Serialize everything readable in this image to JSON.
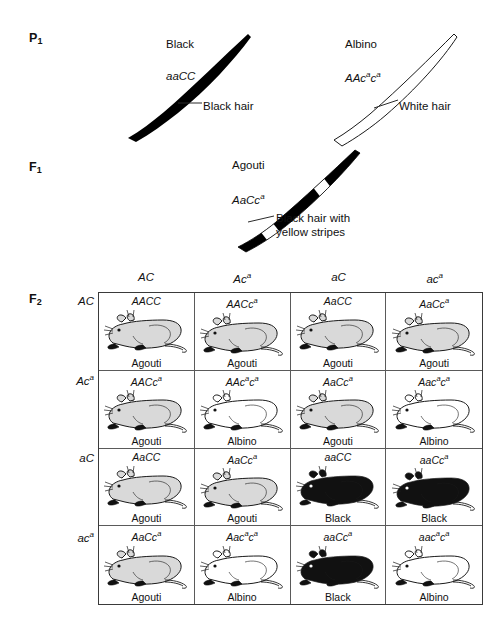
{
  "generations": {
    "p1": {
      "label": "P",
      "subscript": "1"
    },
    "f1": {
      "label": "F",
      "subscript": "1"
    },
    "f2": {
      "label": "F",
      "subscript": "2"
    }
  },
  "p1_parents": [
    {
      "phenotype": "Black",
      "genotype_plain": "aaCC",
      "genotype_parts": [
        {
          "t": "aaCC",
          "sup": false
        }
      ],
      "hair_callout": "Black hair",
      "hair_type": "solid-black"
    },
    {
      "phenotype": "Albino",
      "genotype_plain": "AAc a c a",
      "genotype_parts": [
        {
          "t": "AAc",
          "sup": false
        },
        {
          "t": "a",
          "sup": true
        },
        {
          "t": "c",
          "sup": false
        },
        {
          "t": "a",
          "sup": true
        }
      ],
      "hair_callout": "White hair",
      "hair_type": "white-outline"
    }
  ],
  "f1_offspring": {
    "phenotype": "Agouti",
    "genotype_plain": "AaCc a",
    "genotype_parts": [
      {
        "t": "AaCc",
        "sup": false
      },
      {
        "t": "a",
        "sup": true
      }
    ],
    "hair_callout_line1": "Black hair with",
    "hair_callout_line2": "yellow stripes",
    "hair_type": "banded"
  },
  "punnett": {
    "column_headers": [
      {
        "parts": [
          {
            "t": "AC",
            "sup": false
          }
        ]
      },
      {
        "parts": [
          {
            "t": "Ac",
            "sup": false
          },
          {
            "t": "a",
            "sup": true
          }
        ]
      },
      {
        "parts": [
          {
            "t": "aC",
            "sup": false
          }
        ]
      },
      {
        "parts": [
          {
            "t": "ac",
            "sup": false
          },
          {
            "t": "a",
            "sup": true
          }
        ]
      }
    ],
    "row_headers": [
      {
        "parts": [
          {
            "t": "AC",
            "sup": false
          }
        ]
      },
      {
        "parts": [
          {
            "t": "Ac",
            "sup": false
          },
          {
            "t": "a",
            "sup": true
          }
        ]
      },
      {
        "parts": [
          {
            "t": "aC",
            "sup": false
          }
        ]
      },
      {
        "parts": [
          {
            "t": "ac",
            "sup": false
          },
          {
            "t": "a",
            "sup": true
          }
        ]
      }
    ],
    "cells": [
      {
        "parts": [
          {
            "t": "AACC",
            "sup": false
          }
        ],
        "phenotype": "Agouti",
        "coat": "agouti"
      },
      {
        "parts": [
          {
            "t": "AACc",
            "sup": false
          },
          {
            "t": "a",
            "sup": true
          }
        ],
        "phenotype": "Agouti",
        "coat": "agouti"
      },
      {
        "parts": [
          {
            "t": "AaCC",
            "sup": false
          }
        ],
        "phenotype": "Agouti",
        "coat": "agouti"
      },
      {
        "parts": [
          {
            "t": "AaCc",
            "sup": false
          },
          {
            "t": "a",
            "sup": true
          }
        ],
        "phenotype": "Agouti",
        "coat": "agouti"
      },
      {
        "parts": [
          {
            "t": "AACc",
            "sup": false
          },
          {
            "t": "a",
            "sup": true
          }
        ],
        "phenotype": "Agouti",
        "coat": "agouti"
      },
      {
        "parts": [
          {
            "t": "AAc",
            "sup": false
          },
          {
            "t": "a",
            "sup": true
          },
          {
            "t": "c",
            "sup": false
          },
          {
            "t": "a",
            "sup": true
          }
        ],
        "phenotype": "Albino",
        "coat": "albino"
      },
      {
        "parts": [
          {
            "t": "AaCc",
            "sup": false
          },
          {
            "t": "a",
            "sup": true
          }
        ],
        "phenotype": "Agouti",
        "coat": "agouti"
      },
      {
        "parts": [
          {
            "t": "Aac",
            "sup": false
          },
          {
            "t": "a",
            "sup": true
          },
          {
            "t": "c",
            "sup": false
          },
          {
            "t": "a",
            "sup": true
          }
        ],
        "phenotype": "Albino",
        "coat": "albino"
      },
      {
        "parts": [
          {
            "t": "AaCC",
            "sup": false
          }
        ],
        "phenotype": "Agouti",
        "coat": "agouti"
      },
      {
        "parts": [
          {
            "t": "AaCc",
            "sup": false
          },
          {
            "t": "a",
            "sup": true
          }
        ],
        "phenotype": "Agouti",
        "coat": "agouti"
      },
      {
        "parts": [
          {
            "t": "aaCC",
            "sup": false
          }
        ],
        "phenotype": "Black",
        "coat": "black"
      },
      {
        "parts": [
          {
            "t": "aaCc",
            "sup": false
          },
          {
            "t": "a",
            "sup": true
          }
        ],
        "phenotype": "Black",
        "coat": "black"
      },
      {
        "parts": [
          {
            "t": "AaCc",
            "sup": false
          },
          {
            "t": "a",
            "sup": true
          }
        ],
        "phenotype": "Agouti",
        "coat": "agouti"
      },
      {
        "parts": [
          {
            "t": "Aac",
            "sup": false
          },
          {
            "t": "a",
            "sup": true
          },
          {
            "t": "c",
            "sup": false
          },
          {
            "t": "a",
            "sup": true
          }
        ],
        "phenotype": "Albino",
        "coat": "albino"
      },
      {
        "parts": [
          {
            "t": "aaCc",
            "sup": false
          },
          {
            "t": "a",
            "sup": true
          }
        ],
        "phenotype": "Black",
        "coat": "black"
      },
      {
        "parts": [
          {
            "t": "aac",
            "sup": false
          },
          {
            "t": "a",
            "sup": true
          },
          {
            "t": "c",
            "sup": false
          },
          {
            "t": "a",
            "sup": true
          }
        ],
        "phenotype": "Albino",
        "coat": "albino"
      }
    ]
  },
  "colors": {
    "agouti_fill": "#d9d9d9",
    "albino_fill": "#ffffff",
    "black_fill": "#111111",
    "outline": "#1a1a1a",
    "grid_line": "#5a5a5a",
    "grid_border": "#3a3a3a",
    "leader_line": "#2b2b2b"
  }
}
